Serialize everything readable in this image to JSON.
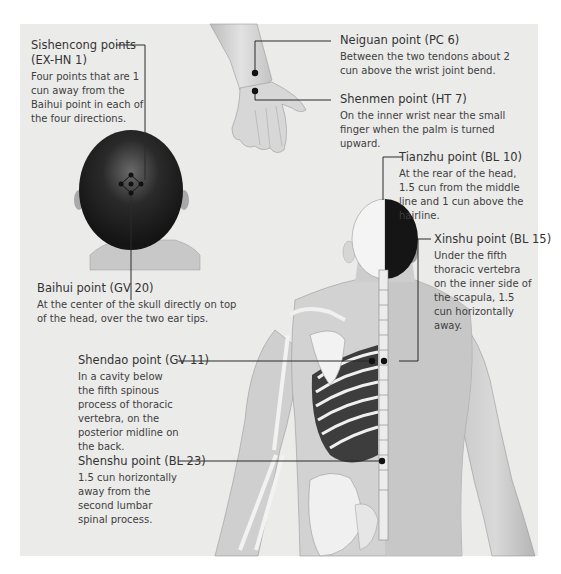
{
  "figure": {
    "background_color": "#ebebea",
    "line_color": "#2a2a2a"
  },
  "points": {
    "sishencong": {
      "title": "Sishencong points",
      "code": "(EX-HN 1)",
      "description": "Four points that are 1 cun away from the Baihui point in each of the four directions."
    },
    "baihui": {
      "title": "Baihui point (GV 20)",
      "description": "At the center of the skull directly on top of the head, over the two ear tips."
    },
    "neiguan": {
      "title": "Neiguan point (PC 6)",
      "description": "Between the two tendons about 2 cun above the wrist joint bend."
    },
    "shenmen": {
      "title": "Shenmen point (HT 7)",
      "description": "On the inner wrist near the small finger when the palm is turned upward."
    },
    "tianzhu": {
      "title": "Tianzhu point (BL 10)",
      "description": "At the rear of the head, 1.5 cun from the middle line and 1 cun above the hairline."
    },
    "xinshu": {
      "title": "Xinshu point (BL 15)",
      "description": "Under the fifth thoracic vertebra on the inner side of the scapula, 1.5 cun horizontally away."
    },
    "shendao": {
      "title": "Shendao point (GV 11)",
      "description": "In a cavity below the fifth spinous process of thoracic vertebra, on the posterior midline on the back."
    },
    "shenshu": {
      "title": "Shenshu point (BL 23)",
      "description": "1.5 cun horizontally away from the second lumbar spinal process."
    }
  }
}
